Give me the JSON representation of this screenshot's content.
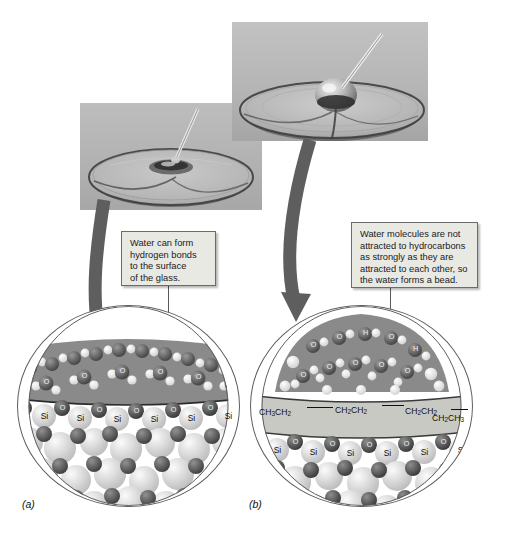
{
  "figure": {
    "panels": [
      {
        "id": "a",
        "label": "(a)",
        "photo_caption": "Water drop spreading flat across a clean glass watch-glass surface",
        "callout": {
          "lines": [
            "Water can form",
            "hydrogen bonds",
            "to the surface",
            "of the glass."
          ],
          "full_text": "Water can form hydrogen bonds to the surface of the glass."
        },
        "layers": {
          "water_label": "water molecules",
          "surface_label": "silica surface",
          "bulk_label": "bulk glass"
        },
        "surface_atoms": [
          "O",
          "Si",
          "O",
          "Si",
          "O",
          "Si",
          "O",
          "Si",
          "O",
          "Si",
          "O",
          "Si",
          "O",
          "Si",
          "O"
        ],
        "water_atom_labels": [
          "H",
          "O",
          "H"
        ]
      },
      {
        "id": "b",
        "label": "(b)",
        "photo_caption": "Water drop beading up on a hydrocarbon-coated watch-glass surface",
        "callout": {
          "lines": [
            "Water molecules are not",
            "attracted to hydrocarbons",
            "as strongly as they are",
            "attracted to each other, so",
            "the water forms a bead."
          ],
          "full_text": "Water molecules are not attracted to hydrocarbons as strongly as they are attracted to each other, so the water forms a bead."
        },
        "layers": {
          "water_label": "water molecules",
          "hydrocarbon_label": "hydrocarbon coating",
          "surface_label": "silica surface",
          "bulk_label": "bulk glass"
        },
        "hydrocarbon_chain": [
          {
            "head": "CH",
            "sub1": "3",
            "tail": "CH",
            "sub2": "2"
          },
          {
            "head": "CH",
            "sub1": "2",
            "tail": "CH",
            "sub2": "2"
          },
          {
            "head": "CH",
            "sub1": "2",
            "tail": "CH",
            "sub2": "2"
          },
          {
            "head": "CH",
            "sub1": "2",
            "tail": "CH",
            "sub2": "3"
          }
        ],
        "hydrocarbon_chain_text": "CH3CH2 — CH2CH2 — CH2CH2 — CH2CH3",
        "surface_atoms": [
          "O",
          "Si",
          "O",
          "Si",
          "O",
          "Si",
          "O",
          "Si",
          "O",
          "Si",
          "O",
          "Si",
          "O",
          "Si",
          "O"
        ],
        "water_atom_labels": [
          "H",
          "O",
          "H"
        ]
      }
    ],
    "arrows": [
      {
        "name": "arrow-photo-a-to-circle-a",
        "from": "photo-a",
        "to": "circle-a"
      },
      {
        "name": "arrow-photo-b-to-circle-b",
        "from": "photo-b",
        "to": "circle-b"
      }
    ],
    "colors": {
      "page_background": "#ffffff",
      "photo_background": "#b3b3b3",
      "callout_fill": "#e9e9e4",
      "callout_border": "#6b6b6b",
      "arrow_fill": "#5e5e5e",
      "water_band": "#8a8a8a",
      "hydrocarbon_band": "#c9c9c4",
      "oxygen_atom": "#4a4a4a",
      "silicon_atom": "#d9d9d9",
      "hydrogen_atom": "#f0f0f0",
      "circle_outline": "#5e5e5e",
      "text": "#111111"
    }
  }
}
